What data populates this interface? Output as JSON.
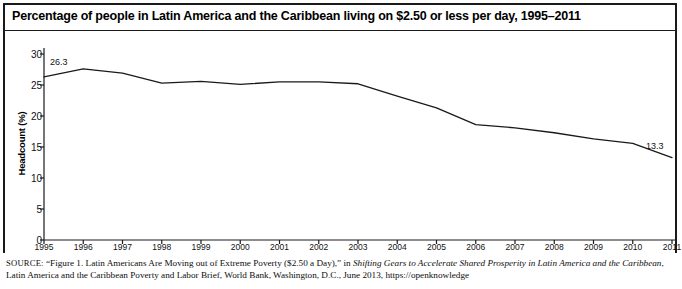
{
  "figure": {
    "title": "Percentage of people in Latin America and the Caribbean living on $2.50 or less per day, 1995–2011",
    "source_prefix": "SOURCE:",
    "source_part1": " “Figure 1. Latin Americans Are Moving out of Extreme Poverty ($2.50 a Day),” in ",
    "source_italic1": "Shifting Gears to Accelerate Shared Prosperity in Latin America and the Caribbean",
    "source_part2": ", Latin America and the Caribbean Poverty and Labor Brief, World Bank, Washington, D.C., June 2013, https://openknowledge"
  },
  "chart_data": {
    "type": "line",
    "title": "Percentage of people in Latin America and the Caribbean living on $2.50 or less per day, 1995–2011",
    "xlabel": "",
    "ylabel": "Headcount (%)",
    "x": [
      1995,
      1996,
      1997,
      1998,
      1999,
      2000,
      2001,
      2002,
      2003,
      2004,
      2005,
      2006,
      2007,
      2008,
      2009,
      2010,
      2011
    ],
    "categories": [
      "1995",
      "1996",
      "1997",
      "1998",
      "1999",
      "2000",
      "2001",
      "2002",
      "2003",
      "2004",
      "2005",
      "2006",
      "2007",
      "2008",
      "2009",
      "2010",
      "2011"
    ],
    "values": [
      26.3,
      27.6,
      26.9,
      25.3,
      25.6,
      25.1,
      25.5,
      25.5,
      25.2,
      23.2,
      21.3,
      18.6,
      18.1,
      17.3,
      16.3,
      15.6,
      13.3
    ],
    "ylim": [
      0,
      30
    ],
    "yticks": [
      0,
      5,
      10,
      15,
      20,
      25,
      30
    ],
    "ytick_labels": [
      "0",
      "5",
      "10",
      "15",
      "20",
      "25",
      "30"
    ],
    "xlim": [
      1995,
      2011
    ],
    "grid": false,
    "legend": false,
    "line_color": "#1a1a1a",
    "point_labels": [
      {
        "year": 1995,
        "value": 26.3,
        "text": "26.3"
      },
      {
        "year": 2011,
        "value": 13.3,
        "text": "13.3"
      }
    ]
  }
}
